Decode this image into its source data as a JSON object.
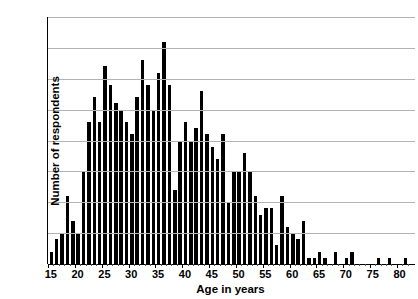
{
  "chart_data": {
    "type": "bar",
    "title": "",
    "xlabel": "Age in years",
    "ylabel": "Number of respondents",
    "xlim": [
      14.3,
      82.7
    ],
    "ylim": [
      0,
      40
    ],
    "ytick_step": 5,
    "yticks": [
      0,
      5,
      10,
      15,
      20,
      25,
      30,
      35,
      40
    ],
    "xticks": [
      15,
      20,
      25,
      30,
      35,
      40,
      45,
      50,
      55,
      60,
      65,
      70,
      75,
      80
    ],
    "grid": "horizontal",
    "legend": "none",
    "bar_color": "#000000",
    "gridline_color": "#b3b3b3",
    "categories": [
      15,
      16,
      17,
      18,
      19,
      20,
      21,
      22,
      23,
      24,
      25,
      26,
      27,
      28,
      29,
      30,
      31,
      32,
      33,
      34,
      35,
      36,
      37,
      38,
      39,
      40,
      41,
      42,
      43,
      44,
      45,
      46,
      47,
      48,
      49,
      50,
      51,
      52,
      53,
      54,
      55,
      56,
      57,
      58,
      59,
      60,
      61,
      62,
      63,
      64,
      65,
      66,
      67,
      68,
      69,
      70,
      71,
      72,
      73,
      74,
      75,
      76,
      77,
      78,
      79,
      80,
      81,
      82
    ],
    "values": [
      2,
      4,
      5,
      11,
      7,
      5,
      15,
      23,
      27,
      23,
      32,
      29,
      26,
      25,
      23,
      21,
      27,
      33,
      29,
      25,
      31,
      36,
      29,
      12,
      20,
      23,
      20,
      22,
      28,
      21,
      19,
      17,
      21,
      10,
      15,
      15,
      18,
      15,
      11,
      8,
      9,
      9,
      3,
      11,
      6,
      5,
      4,
      7,
      1,
      1,
      2,
      1,
      0,
      2,
      0,
      1,
      2,
      0,
      0,
      0,
      0,
      1,
      0,
      1,
      0,
      0,
      1,
      0
    ]
  },
  "axes": {
    "ytick_labels": [
      "40",
      "35",
      "30",
      "25",
      "20",
      "15",
      "10",
      "5",
      "0"
    ],
    "xtick_labels": [
      "15",
      "20",
      "25",
      "30",
      "35",
      "40",
      "45",
      "50",
      "55",
      "60",
      "65",
      "70",
      "75",
      "80"
    ]
  }
}
